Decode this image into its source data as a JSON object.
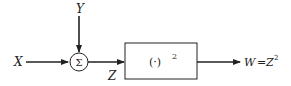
{
  "diagram": {
    "inputs": {
      "x_label": "X",
      "y_label": "Y"
    },
    "summer": {
      "symbol": "Σ"
    },
    "intermediate": {
      "label": "Z"
    },
    "block": {
      "base": "(·)",
      "exponent": "2"
    },
    "output": {
      "lhs": "W",
      "eq": "=",
      "rhs": "Z",
      "exponent": "2"
    }
  }
}
